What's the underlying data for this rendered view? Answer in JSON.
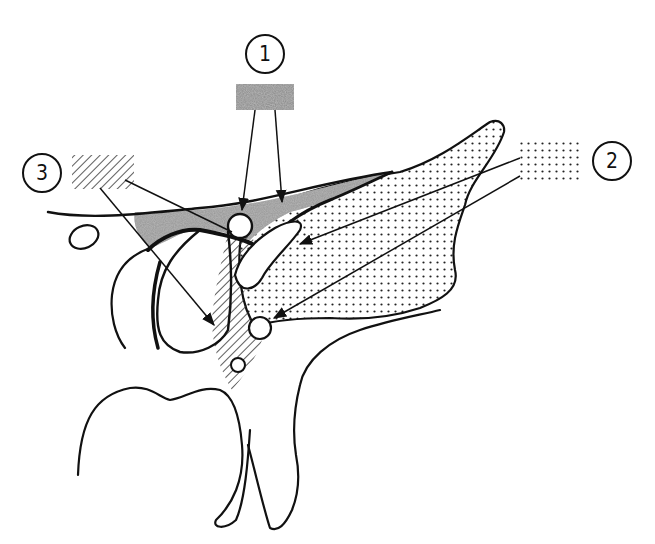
{
  "figure": {
    "type": "anatomical-line-drawing",
    "background": "#ffffff",
    "ink_color": "#111111"
  },
  "callouts": [
    {
      "id": 1,
      "label": "1",
      "pattern": "gray-stipple",
      "swatch_color": "#8a8a8a",
      "region_fill": "#a9a9a9",
      "arrow_count": 2
    },
    {
      "id": 2,
      "label": "2",
      "pattern": "dots",
      "swatch_color": "#222222",
      "region_fill": "dotted",
      "arrow_count": 2
    },
    {
      "id": 3,
      "label": "3",
      "pattern": "diagonal-hatch",
      "swatch_color": "#333333",
      "region_fill": "hatched",
      "arrow_count": 2
    }
  ]
}
